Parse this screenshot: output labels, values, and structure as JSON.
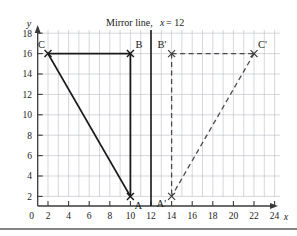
{
  "figure": {
    "title": "Mirror line, x = 12",
    "title_parts": {
      "lead": "Mirror line,",
      "variable": "x",
      "equals": "= 12"
    },
    "background_color": "#ffffff",
    "grid_color": "#b9bcc4",
    "axis_color": "#3a3a3a",
    "shape_color": "#1a1a1a",
    "image_color": "#4a4a4a"
  },
  "axes": {
    "x": {
      "name": "x",
      "ticks": [
        0,
        2,
        4,
        6,
        8,
        10,
        12,
        14,
        16,
        18,
        20,
        22,
        24
      ],
      "tick_labels": [
        "0",
        "2",
        "4",
        "6",
        "8",
        "10",
        "12",
        "14",
        "16",
        "18",
        "20",
        "22",
        "24"
      ],
      "min": 0,
      "max": 25
    },
    "y": {
      "name": "y",
      "ticks": [
        0,
        2,
        4,
        6,
        8,
        10,
        12,
        14,
        16,
        18
      ],
      "tick_labels": [
        "0",
        "2",
        "4",
        "6",
        "8",
        "10",
        "12",
        "14",
        "16",
        "18"
      ],
      "min": 0,
      "max": 19
    }
  },
  "mirror_line": {
    "label": "x = 12",
    "x_value": 12,
    "style": "solid"
  },
  "shapes": [
    {
      "name": "triangle-abc",
      "style": "solid",
      "vertices": [
        {
          "label": "A",
          "x": 10,
          "y": 2,
          "label_dx": 4,
          "label_dy": 13
        },
        {
          "label": "B",
          "x": 10,
          "y": 16,
          "label_dx": 5,
          "label_dy": -5
        },
        {
          "label": "C",
          "x": 2,
          "y": 16,
          "label_dx": -10,
          "label_dy": -5
        }
      ]
    },
    {
      "name": "triangle-abc-image",
      "style": "dashed",
      "vertices": [
        {
          "label": "A'",
          "x": 14,
          "y": 2,
          "label_dx": -14,
          "label_dy": 11
        },
        {
          "label": "B'",
          "x": 14,
          "y": 16,
          "label_dx": -14,
          "label_dy": -4
        },
        {
          "label": "C'",
          "x": 22,
          "y": 16,
          "label_dx": 5,
          "label_dy": -5
        }
      ]
    }
  ],
  "footer_rule": {
    "present": true
  }
}
